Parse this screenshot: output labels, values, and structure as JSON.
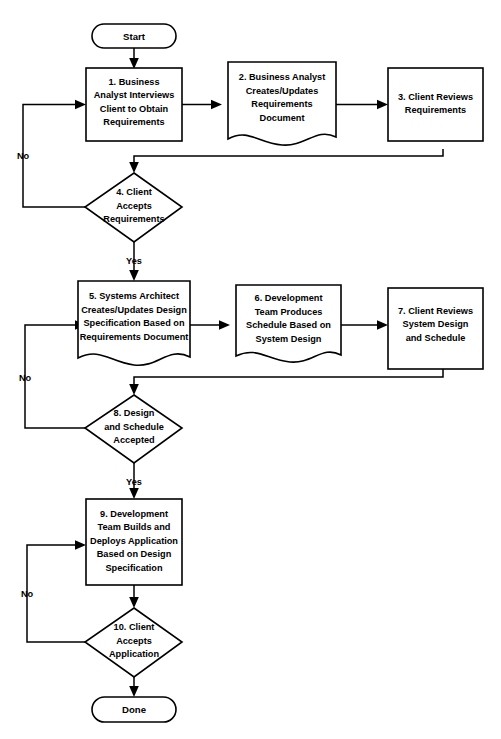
{
  "diagram": {
    "colors": {
      "stroke": "#000000",
      "fill": "#ffffff",
      "background": "#ffffff",
      "text": "#000000"
    },
    "nodes": {
      "start": {
        "shape": "terminator",
        "label": "Start"
      },
      "step1": {
        "shape": "process",
        "lines": [
          "1. Business",
          "Analyst Interviews",
          "Client to Obtain",
          "Requirements"
        ]
      },
      "step2": {
        "shape": "document",
        "lines": [
          "2. Business Analyst",
          "Creates/Updates",
          "Requirements",
          "Document"
        ]
      },
      "step3": {
        "shape": "process",
        "lines": [
          "3. Client Reviews",
          "Requirements"
        ]
      },
      "step4": {
        "shape": "decision",
        "lines": [
          "4. Client",
          "Accepts",
          "Requirements"
        ]
      },
      "step5": {
        "shape": "document",
        "lines": [
          "5. Systems Architect",
          "Creates/Updates Design",
          "Specification Based on",
          "Requirements Document"
        ]
      },
      "step6": {
        "shape": "document",
        "lines": [
          "6. Development",
          "Team Produces",
          "Schedule Based on",
          "System Design"
        ]
      },
      "step7": {
        "shape": "process",
        "lines": [
          "7. Client Reviews",
          "System Design",
          "and Schedule"
        ]
      },
      "step8": {
        "shape": "decision",
        "lines": [
          "8. Design",
          "and Schedule",
          "Accepted"
        ]
      },
      "step9": {
        "shape": "process",
        "lines": [
          "9. Development",
          "Team Builds and",
          "Deploys Application",
          "Based on Design",
          "Specification"
        ]
      },
      "step10": {
        "shape": "decision",
        "lines": [
          "10. Client",
          "Accepts",
          "Application"
        ]
      },
      "done": {
        "shape": "terminator",
        "label": "Done"
      }
    },
    "edge_labels": {
      "no_1": "No",
      "yes_1": "Yes",
      "no_2": "No",
      "yes_2": "Yes",
      "no_3": "No"
    }
  }
}
